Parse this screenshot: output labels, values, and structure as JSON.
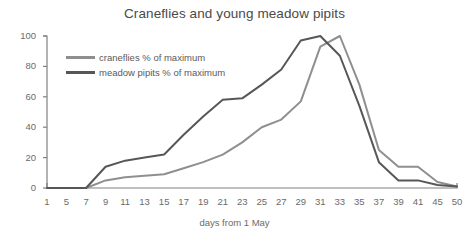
{
  "chart_data": {
    "type": "line",
    "title": "Craneflies and young meadow pipits",
    "xlabel": "days from 1 May",
    "ylabel": "",
    "grid": false,
    "legend_position": "top-left-inside",
    "xlim": [
      1,
      50
    ],
    "ylim": [
      0,
      100
    ],
    "yticks": [
      0,
      20,
      40,
      60,
      80,
      100
    ],
    "xticks": [
      1,
      5,
      7,
      9,
      11,
      13,
      15,
      17,
      19,
      21,
      23,
      25,
      27,
      29,
      31,
      33,
      35,
      37,
      39,
      41,
      45,
      50
    ],
    "x": [
      1,
      5,
      7,
      9,
      11,
      13,
      15,
      17,
      19,
      21,
      23,
      25,
      27,
      29,
      31,
      33,
      35,
      37,
      39,
      41,
      45,
      50
    ],
    "series": [
      {
        "name": "craneflies % of maximum",
        "color": "#8f8f8f",
        "values": [
          0,
          0,
          0,
          5,
          7,
          8,
          9,
          13,
          17,
          22,
          30,
          40,
          45,
          57,
          93,
          100,
          68,
          25,
          14,
          14,
          4,
          1
        ]
      },
      {
        "name": "meadow pipits % of maximum",
        "color": "#575757",
        "values": [
          0,
          0,
          0,
          14,
          18,
          20,
          22,
          35,
          47,
          58,
          59,
          68,
          78,
          97,
          100,
          87,
          54,
          17,
          5,
          5,
          2,
          1
        ]
      }
    ]
  },
  "legend": {
    "items": [
      {
        "label": "craneflies % of maximum"
      },
      {
        "label": "meadow pipits % of maximum"
      }
    ]
  },
  "colors": {
    "craneflies": "#8f8f8f",
    "meadow_pipits": "#575757",
    "axis": "#808080",
    "text": "#6b6b6b",
    "title": "#4a4a4a",
    "background": "#ffffff"
  }
}
